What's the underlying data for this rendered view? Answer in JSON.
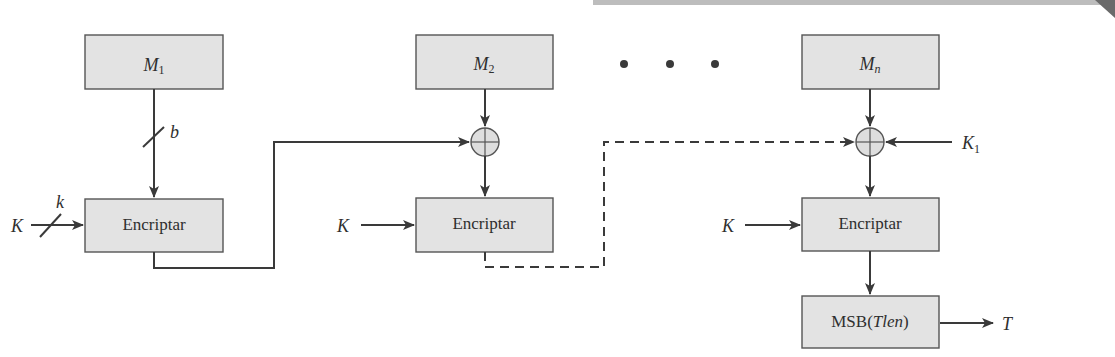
{
  "diagram": {
    "blocks": {
      "m1": {
        "main": "M",
        "sub": "1"
      },
      "m2": {
        "main": "M",
        "sub": "2"
      },
      "mn": {
        "main": "M",
        "sub": "n"
      }
    },
    "encrypt_label": "Encriptar",
    "msb_box": {
      "prefix": "MSB(",
      "var": "Tlen",
      "suffix": ")"
    },
    "key_label": "K",
    "subkey": {
      "main": "K",
      "sub": "1"
    },
    "bit_width_block": "b",
    "bit_width_key": "k",
    "output_label": "T",
    "ellipsis_dots": 3,
    "colors": {
      "box_fill": "#e3e3e3",
      "line": "#3a3a3a",
      "scan_band": "#bdbdbd"
    }
  }
}
